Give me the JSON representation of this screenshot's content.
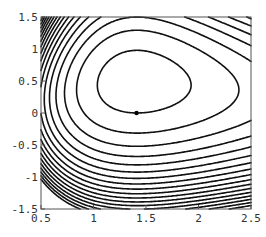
{
  "chart_data": {
    "type": "contour",
    "title": "",
    "xlabel": "",
    "ylabel": "",
    "xlim": [
      0.5,
      2.5
    ],
    "ylim": [
      -1.5,
      1.5
    ],
    "x_ticks": [
      {
        "value": 0.5,
        "label": "0.5"
      },
      {
        "value": 1,
        "label": "1"
      },
      {
        "value": 1.5,
        "label": "1.5"
      },
      {
        "value": 2,
        "label": "2"
      },
      {
        "value": 2.5,
        "label": "2.5"
      }
    ],
    "y_ticks": [
      {
        "value": 1.5,
        "label": "1.5"
      },
      {
        "value": 1,
        "label": "1"
      },
      {
        "value": 0.5,
        "label": "0.5"
      },
      {
        "value": 0,
        "label": "0"
      },
      {
        "value": -0.5,
        "label": "-0.5"
      },
      {
        "value": -1,
        "label": "-1"
      },
      {
        "value": -1.5,
        "label": "-1.5"
      }
    ],
    "critical_point": {
      "x": 1.41,
      "y": 0.0,
      "marker": "dot"
    },
    "grid": false,
    "legend": null,
    "line_color": "#111111",
    "frame_color": "#555555"
  },
  "layout": {
    "frame": {
      "left": 41,
      "top": 17,
      "right": 251,
      "bottom": 209
    }
  }
}
